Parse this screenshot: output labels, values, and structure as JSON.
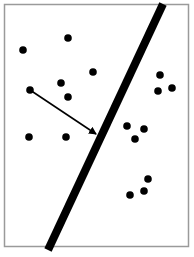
{
  "diagram": {
    "title": "",
    "colors": {
      "background": "#ffffff",
      "frame": "#9a9a9a",
      "ink": "#000000"
    },
    "points_left": [
      {
        "id": "p1"
      },
      {
        "id": "p2"
      },
      {
        "id": "p3"
      },
      {
        "id": "p4"
      },
      {
        "id": "p5"
      },
      {
        "id": "p6"
      },
      {
        "id": "p7"
      },
      {
        "id": "p8"
      }
    ],
    "points_right": [
      {
        "id": "q1"
      },
      {
        "id": "q2"
      },
      {
        "id": "q3"
      },
      {
        "id": "q4"
      },
      {
        "id": "q5"
      },
      {
        "id": "q6"
      },
      {
        "id": "q7"
      },
      {
        "id": "q8"
      },
      {
        "id": "q9"
      }
    ],
    "arrow": {
      "from": "p6",
      "to": "separator"
    }
  }
}
